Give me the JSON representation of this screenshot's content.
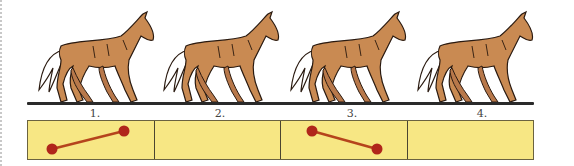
{
  "figure": {
    "frames": [
      {
        "label": "1.",
        "footfall": {
          "dots": [
            [
              24,
              28
            ],
            [
              96,
              10
            ]
          ]
        }
      },
      {
        "label": "2.",
        "footfall": {
          "dots": []
        }
      },
      {
        "label": "3.",
        "footfall": {
          "dots": [
            [
              31,
              10
            ],
            [
              96,
              28
            ]
          ]
        }
      },
      {
        "label": "4.",
        "footfall": {
          "dots": []
        }
      }
    ],
    "colors": {
      "horse_body": "#c98a52",
      "horse_outline": "#2a1a10",
      "tail": "#ffffff",
      "box_fill": "#f7e784",
      "dot": "#b0261b",
      "line": "#b5441c"
    }
  }
}
